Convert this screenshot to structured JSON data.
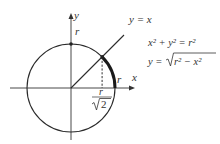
{
  "diagram": {
    "axis_labels": {
      "x": "x",
      "y": "y"
    },
    "point_labels": {
      "top": "r",
      "right": "r"
    },
    "line_label": "y = x",
    "foot_label": {
      "numerator": "r",
      "denominator": "2",
      "radical": "√"
    },
    "equations": [
      {
        "id": "circle",
        "text": "x² + y² = r²"
      },
      {
        "id": "upper",
        "lhs": "y = ",
        "radical": "√",
        "radicand": "r² − x²"
      }
    ],
    "colors": {
      "curve": "#2a2a2a",
      "highlight_arc": "#1a1a1a"
    }
  }
}
